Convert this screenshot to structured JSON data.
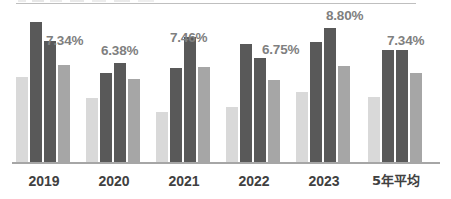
{
  "chart_data": {
    "type": "bar",
    "title": "",
    "xlabel": "",
    "ylabel": "",
    "grid": false,
    "legend_position": "none",
    "categories": [
      "2019",
      "2020",
      "2021",
      "2022",
      "2023",
      "5年平均"
    ],
    "series": [
      {
        "name": "series-1",
        "color": "#d9d9d9",
        "values": [
          86,
          65,
          51,
          56,
          71,
          66
        ]
      },
      {
        "name": "series-2",
        "color": "#595959",
        "values": [
          141,
          90,
          95,
          119,
          121,
          113
        ]
      },
      {
        "name": "series-3",
        "color": "#595959",
        "values": [
          122,
          100,
          126,
          105,
          135,
          113
        ]
      },
      {
        "name": "series-4",
        "color": "#a6a6a6",
        "values": [
          98,
          84,
          96,
          83,
          97,
          90
        ]
      }
    ],
    "data_labels": [
      "7.34%",
      "6.38%",
      "7.46%",
      "6.75%",
      "8.80%",
      "7.34%"
    ],
    "ylim": [
      0,
      150
    ],
    "label_color": "#7f7f7f",
    "axis_color": "#a6a6a6",
    "tick_label_color": "#404040"
  },
  "axis": {
    "tick_labels": [
      "2019",
      "2020",
      "2021",
      "2022",
      "2023",
      "5年平均"
    ]
  }
}
